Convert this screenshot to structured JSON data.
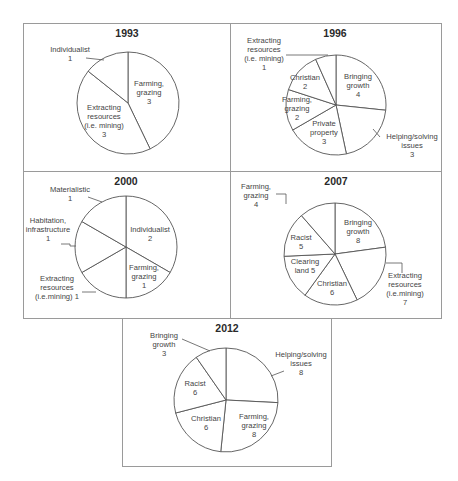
{
  "chart_data": [
    {
      "type": "pie",
      "title": "1993",
      "categories": [
        "Farming, grazing",
        "Extracting resources (i.e. mining)",
        "Individualist"
      ],
      "values": [
        3,
        3,
        1
      ],
      "labels": [
        {
          "lines": [
            "Farming,",
            "grazing",
            "3"
          ],
          "x": 149,
          "y": 86
        },
        {
          "lines": [
            "Extracting",
            "resources",
            "(i.e. mining)",
            "3"
          ],
          "x": 104,
          "y": 110
        },
        {
          "lines": [
            "Individualist",
            "1"
          ],
          "x": 70,
          "y": 52
        }
      ],
      "leaders": [
        [
          [
            86,
            58
          ],
          [
            104,
            60
          ]
        ]
      ],
      "panel": {
        "x": 23,
        "y": 23,
        "w": 208,
        "h": 149
      },
      "center": [
        128,
        103
      ],
      "radius": 51,
      "title_pos": [
        127,
        37
      ]
    },
    {
      "type": "pie",
      "title": "1996",
      "categories": [
        "Bringing growth",
        "Helping/solving issues",
        "Private property",
        "Farming, grazing",
        "Christian",
        "Extracting resources (i.e. mining)"
      ],
      "values": [
        4,
        3,
        3,
        2,
        2,
        1
      ],
      "labels": [
        {
          "lines": [
            "Bringing",
            "growth",
            "4"
          ],
          "x": 358,
          "y": 79
        },
        {
          "lines": [
            "Helping/solving",
            "issues",
            "3"
          ],
          "x": 412,
          "y": 139
        },
        {
          "lines": [
            "Private",
            "property",
            "3"
          ],
          "x": 324,
          "y": 126
        },
        {
          "lines": [
            "Farming,",
            "grazing",
            "2"
          ],
          "x": 297,
          "y": 102
        },
        {
          "lines": [
            "Christian",
            "2"
          ],
          "x": 305,
          "y": 80
        },
        {
          "lines": [
            "Extracting",
            "resources",
            "(i.e. mining)",
            "1"
          ],
          "x": 264,
          "y": 43
        }
      ],
      "leaders": [
        [
          [
            286,
            55
          ],
          [
            328,
            55
          ]
        ],
        [
          [
            380,
            137
          ],
          [
            373,
            129
          ]
        ]
      ],
      "panel": {
        "x": 230,
        "y": 23,
        "w": 212,
        "h": 149
      },
      "center": [
        336,
        105
      ],
      "radius": 50,
      "title_pos": [
        335,
        37
      ]
    },
    {
      "type": "pie",
      "title": "2000",
      "categories": [
        "Individualist",
        "Farming, grazing",
        "Extracting resources (i.e.mining)",
        "Habitation, infrastructure",
        "Materialistic"
      ],
      "values": [
        2,
        1,
        1,
        1,
        1
      ],
      "labels": [
        {
          "lines": [
            "Individualist",
            "2"
          ],
          "x": 150,
          "y": 232
        },
        {
          "lines": [
            "Farming,",
            "grazing",
            "1"
          ],
          "x": 144,
          "y": 270
        },
        {
          "lines": [
            "Extracting",
            "resources",
            "(i.e.mining) 1"
          ],
          "x": 57,
          "y": 281
        },
        {
          "lines": [
            "Habitation,",
            "infrastructure",
            "1"
          ],
          "x": 48,
          "y": 223
        },
        {
          "lines": [
            "Materialistic",
            "1"
          ],
          "x": 70,
          "y": 192
        }
      ],
      "leaders": [
        [
          [
            88,
            197
          ],
          [
            102,
            202
          ]
        ],
        [
          [
            61,
            244
          ],
          [
            70,
            244
          ],
          [
            70,
            246
          ],
          [
            76,
            246
          ]
        ],
        [
          [
            82,
            292
          ],
          [
            96,
            292
          ]
        ]
      ],
      "panel": {
        "x": 23,
        "y": 171,
        "w": 208,
        "h": 148
      },
      "center": [
        126,
        247
      ],
      "radius": 51,
      "title_pos": [
        126,
        185
      ]
    },
    {
      "type": "pie",
      "title": "2007",
      "categories": [
        "Bringing growth",
        "Extracting resources (i.e.mining)",
        "Christian",
        "Clearing land",
        "Racist",
        "Farming, grazing"
      ],
      "values": [
        8,
        7,
        6,
        5,
        5,
        4
      ],
      "labels": [
        {
          "lines": [
            "Bringing",
            "growth",
            "8"
          ],
          "x": 358,
          "y": 225
        },
        {
          "lines": [
            "Extracting",
            "resources",
            "(i.e.mining)",
            "7"
          ],
          "x": 405,
          "y": 278
        },
        {
          "lines": [
            "Christian",
            "6"
          ],
          "x": 332,
          "y": 286
        },
        {
          "lines": [
            "Clearing",
            "land 5"
          ],
          "x": 305,
          "y": 264
        },
        {
          "lines": [
            "Racist",
            "5"
          ],
          "x": 301,
          "y": 240
        },
        {
          "lines": [
            "Farming,",
            "grazing",
            "4"
          ],
          "x": 256,
          "y": 189
        }
      ],
      "leaders": [
        [
          [
            276,
            194
          ],
          [
            286,
            194
          ],
          [
            286,
            204
          ]
        ],
        [
          [
            386,
            263
          ],
          [
            402,
            263
          ],
          [
            402,
            273
          ]
        ]
      ],
      "panel": {
        "x": 230,
        "y": 171,
        "w": 212,
        "h": 148
      },
      "center": [
        335,
        254
      ],
      "radius": 51,
      "title_pos": [
        336,
        185
      ]
    },
    {
      "type": "pie",
      "title": "2012",
      "categories": [
        "Helping/solving issues",
        "Farming, grazing",
        "Christian",
        "Racist",
        "Bringing growth"
      ],
      "values": [
        8,
        8,
        6,
        6,
        3
      ],
      "labels": [
        {
          "lines": [
            "Helping/solving",
            "issues",
            "8"
          ],
          "x": 301,
          "y": 357
        },
        {
          "lines": [
            "Farming,",
            "grazing",
            "8"
          ],
          "x": 254,
          "y": 419
        },
        {
          "lines": [
            "Christian",
            "6"
          ],
          "x": 206,
          "y": 421
        },
        {
          "lines": [
            "Racist",
            "6"
          ],
          "x": 195,
          "y": 386
        },
        {
          "lines": [
            "Bringing",
            "growth",
            "3"
          ],
          "x": 164,
          "y": 338
        }
      ],
      "leaders": [
        [
          [
            182,
            339
          ],
          [
            210,
            351
          ]
        ],
        [
          [
            271,
            376
          ],
          [
            284,
            371
          ]
        ]
      ],
      "panel": {
        "x": 122,
        "y": 318,
        "w": 210,
        "h": 149
      },
      "center": [
        226,
        400
      ],
      "radius": 52,
      "title_pos": [
        227,
        332
      ]
    }
  ]
}
